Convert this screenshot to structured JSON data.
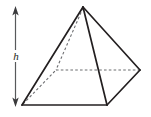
{
  "figure": {
    "shape_name": "square pyramid",
    "height_label": "h",
    "colors": {
      "solid_edge": "#231f20",
      "hidden_edge": "#6d6e71",
      "dimension_line": "#58595b",
      "background": "#ffffff"
    },
    "vertices": {
      "apex": [
        83,
        7
      ],
      "front_left": [
        22,
        105
      ],
      "front_right": [
        107,
        105
      ],
      "right": [
        140,
        70
      ],
      "back_hidden": [
        56,
        70
      ]
    },
    "solid_edges": [
      {
        "name": "apex-to-front-left",
        "from": [
          83,
          7
        ],
        "to": [
          22,
          105
        ]
      },
      {
        "name": "apex-to-front-right",
        "from": [
          83,
          7
        ],
        "to": [
          107,
          105
        ]
      },
      {
        "name": "apex-to-right",
        "from": [
          83,
          7
        ],
        "to": [
          140,
          70
        ]
      },
      {
        "name": "base-front",
        "from": [
          22,
          105
        ],
        "to": [
          107,
          105
        ]
      },
      {
        "name": "base-right",
        "from": [
          107,
          105
        ],
        "to": [
          140,
          70
        ]
      }
    ],
    "hidden_edges": [
      {
        "name": "apex-to-back-hidden",
        "from": [
          83,
          7
        ],
        "to": [
          56,
          70
        ]
      },
      {
        "name": "base-back-left",
        "from": [
          22,
          105
        ],
        "to": [
          56,
          70
        ]
      },
      {
        "name": "base-back-right",
        "from": [
          56,
          70
        ],
        "to": [
          140,
          70
        ]
      }
    ],
    "dimension_arrow": {
      "name": "height-arrow",
      "x": 15,
      "y_top": 8,
      "y_bottom": 105,
      "double_headed": true
    }
  }
}
